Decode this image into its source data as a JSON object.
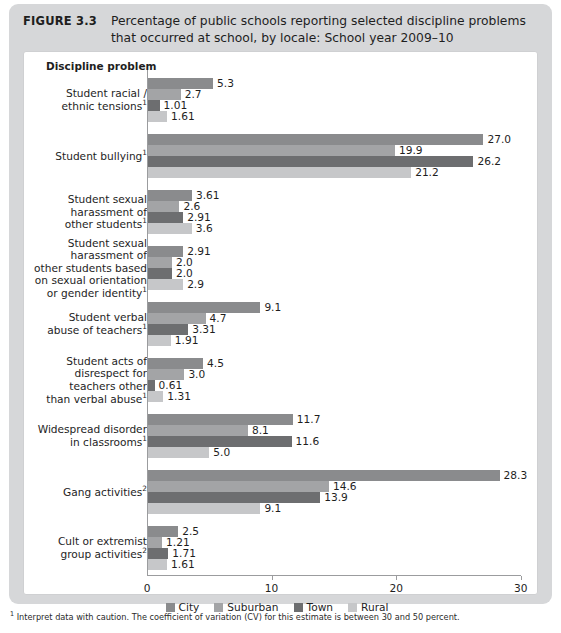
{
  "figure": {
    "number": "FIGURE 3.3",
    "title": "Percentage of public schools reporting selected discipline problems that occurred at school, by locale: School year 2009–10"
  },
  "footnote": {
    "marker": "1",
    "text": " Interpret data with caution. The coefficient of variation (CV) for this estimate is between 30 and 50 percent."
  },
  "colors": {
    "city": "#8a8b8d",
    "suburban": "#a3a4a6",
    "town": "#6d6e70",
    "rural": "#c6c7c9",
    "panel_background": "#ffffff",
    "figure_background": "#d6d7d9",
    "axis": "#9b9c9e"
  },
  "chart_data": {
    "type": "bar",
    "orientation": "horizontal",
    "title": "Percentage of public schools reporting selected discipline problems that occurred at school, by locale: School year 2009–10",
    "axis_title": "Discipline problem",
    "xlabel": "",
    "ylabel": "Discipline problem",
    "xlim": [
      0,
      30
    ],
    "xticks": [
      0,
      10,
      20,
      30
    ],
    "xtick_labels": [
      "0",
      "10",
      "20",
      "30"
    ],
    "grid": false,
    "legend_position": "bottom",
    "legend": [
      "City",
      "Suburban",
      "Town",
      "Rural"
    ],
    "categories": [
      "Student racial / ethnic tensions",
      "Student bullying",
      "Student sexual harassment of other students",
      "Student sexual harassment of other students based on sexual orientation or gender identity",
      "Student verbal abuse of teachers",
      "Student acts of disrespect for teachers other than verbal abuse",
      "Widespread disorder in classrooms",
      "Gang activities",
      "Cult or extremist group activities"
    ],
    "category_footnotes": [
      "1",
      "1",
      "1",
      "1",
      "1",
      "1",
      "1",
      "2",
      "2"
    ],
    "category_lines": [
      [
        "Student racial /",
        "ethnic tensions"
      ],
      [
        "Student bullying"
      ],
      [
        "Student sexual",
        "harassment of",
        "other students"
      ],
      [
        "Student sexual",
        "harassment of",
        "other students based",
        "on sexual orientation",
        "or gender identity"
      ],
      [
        "Student verbal",
        "abuse of teachers"
      ],
      [
        "Student acts of",
        "disrespect for",
        "teachers other",
        "than verbal abuse"
      ],
      [
        "Widespread disorder",
        "in classrooms"
      ],
      [
        "Gang activities"
      ],
      [
        "Cult or extremist",
        "group activities"
      ]
    ],
    "series": [
      {
        "name": "City",
        "values": [
          5.3,
          27.0,
          3.61,
          2.91,
          9.1,
          4.5,
          11.7,
          28.3,
          2.5
        ]
      },
      {
        "name": "Suburban",
        "values": [
          2.7,
          19.9,
          2.6,
          2.0,
          4.7,
          3.0,
          8.1,
          14.6,
          1.21
        ]
      },
      {
        "name": "Town",
        "values": [
          1.01,
          26.2,
          2.91,
          2.0,
          3.31,
          0.61,
          11.6,
          13.9,
          1.71
        ]
      },
      {
        "name": "Rural",
        "values": [
          1.61,
          21.2,
          3.6,
          2.9,
          1.91,
          1.31,
          5.0,
          9.1,
          1.61
        ]
      }
    ],
    "value_labels": [
      [
        "5.3",
        "2.7",
        "1.01",
        "1.61"
      ],
      [
        "27.0",
        "19.9",
        "26.2",
        "21.2"
      ],
      [
        "3.61",
        "2.6",
        "2.91",
        "3.6"
      ],
      [
        "2.91",
        "2.0",
        "2.0",
        "2.9"
      ],
      [
        "9.1",
        "4.7",
        "3.31",
        "1.91"
      ],
      [
        "4.5",
        "3.0",
        "0.61",
        "1.31"
      ],
      [
        "11.7",
        "8.1",
        "11.6",
        "5.0"
      ],
      [
        "28.3",
        "14.6",
        "13.9",
        "9.1"
      ],
      [
        "2.5",
        "1.21",
        "1.71",
        "1.61"
      ]
    ]
  }
}
